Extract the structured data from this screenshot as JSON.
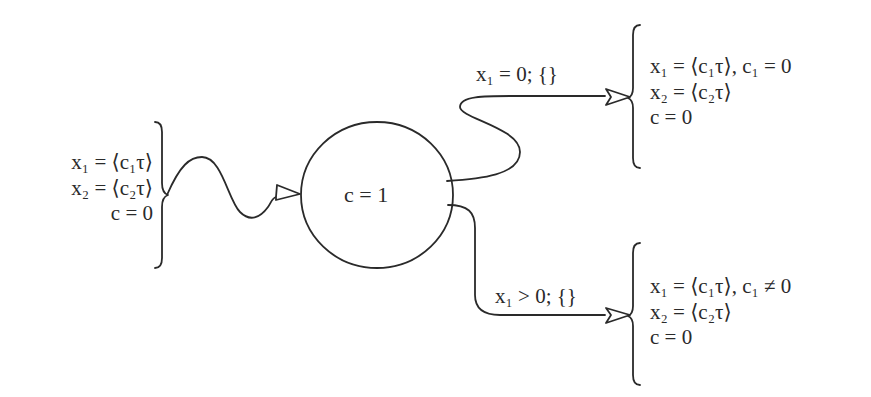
{
  "diagram": {
    "type": "state-transition",
    "initial_state": {
      "lines": [
        "x₁ = ⟨c₁τ⟩",
        "x₂ = ⟨c₂τ⟩",
        "c = 0"
      ]
    },
    "node": {
      "label": "c = 1"
    },
    "transitions": [
      {
        "label": "x₁ = 0; {}",
        "target_lines": [
          "x₁ = ⟨c₁τ⟩, c₁ = 0",
          "x₂ = ⟨c₂τ⟩",
          "c = 0"
        ]
      },
      {
        "label": "x₁ > 0; {}",
        "target_lines": [
          "x₁ = ⟨c₁τ⟩, c₁ ≠ 0",
          "x₂ = ⟨c₂τ⟩",
          "c = 0"
        ]
      }
    ],
    "colors": {
      "stroke": "#2a2a2a",
      "background": "#ffffff"
    }
  }
}
